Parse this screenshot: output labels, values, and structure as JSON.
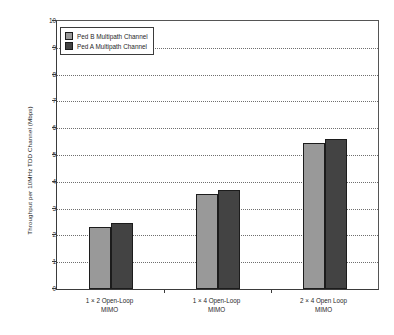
{
  "chart_data": {
    "type": "bar",
    "title": "",
    "xlabel": "",
    "ylabel": "Throughput per 10MHz TDD Channel (Mbps)",
    "ylim": [
      0,
      10
    ],
    "ytick_labels": [
      "10",
      "9",
      "8",
      "7",
      "6",
      "5",
      "4",
      "3",
      "2",
      "1",
      "0"
    ],
    "ytick_values": [
      10,
      9,
      8,
      7,
      6,
      5,
      4,
      3,
      2,
      1,
      0
    ],
    "grid": true,
    "grid_axis": "y",
    "legend_position": "upper-left-inside",
    "categories": [
      {
        "line1": "1 × 2 Open-Loop",
        "line2": "MIMO"
      },
      {
        "line1": "1 × 4 Open-Loop",
        "line2": "MIMO"
      },
      {
        "line1": "2 × 4 Open Loop",
        "line2": "MIMO"
      }
    ],
    "series": [
      {
        "name": "Ped B Multipath Channel",
        "color": "#999999",
        "values": [
          2.3,
          3.55,
          5.45
        ]
      },
      {
        "name": "Ped A Multipath Channel",
        "color": "#434343",
        "values": [
          2.45,
          3.7,
          5.6
        ]
      }
    ]
  },
  "caption": {
    "text": ""
  }
}
